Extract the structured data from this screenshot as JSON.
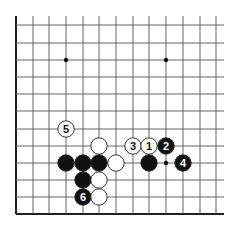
{
  "diagram": {
    "type": "go-board-fragment",
    "grid": {
      "columns_x": [
        16,
        33,
        49,
        66,
        83,
        99,
        116,
        133,
        149,
        166,
        183,
        200,
        216
      ],
      "rows_y": [
        25,
        43,
        60,
        77,
        94,
        111,
        129,
        146,
        163,
        180,
        197,
        214
      ],
      "line_extend_right": 224,
      "line_extend_top": 16,
      "edges": {
        "left": true,
        "bottom": true,
        "top": false,
        "right": false
      },
      "line_color": "#555555",
      "edge_color": "#222222"
    },
    "star_points": [
      {
        "col": 3,
        "row": 2
      },
      {
        "col": 9,
        "row": 2
      },
      {
        "col": 9,
        "row": 8
      }
    ],
    "stones": [
      {
        "color": "white",
        "col": 3,
        "row": 6,
        "label": "5"
      },
      {
        "color": "white",
        "col": 5,
        "row": 7,
        "label": ""
      },
      {
        "color": "white",
        "col": 7,
        "row": 7,
        "label": "3"
      },
      {
        "color": "white",
        "col": 8,
        "row": 7,
        "label": "1"
      },
      {
        "color": "black",
        "col": 9,
        "row": 7,
        "label": "2"
      },
      {
        "color": "black",
        "col": 3,
        "row": 8,
        "label": ""
      },
      {
        "color": "black",
        "col": 4,
        "row": 8,
        "label": ""
      },
      {
        "color": "black",
        "col": 5,
        "row": 8,
        "label": ""
      },
      {
        "color": "white",
        "col": 6,
        "row": 8,
        "label": ""
      },
      {
        "color": "black",
        "col": 8,
        "row": 8,
        "label": ""
      },
      {
        "color": "black",
        "col": 10,
        "row": 8,
        "label": "4"
      },
      {
        "color": "black",
        "col": 4,
        "row": 9,
        "label": ""
      },
      {
        "color": "white",
        "col": 5,
        "row": 9,
        "label": ""
      },
      {
        "color": "black",
        "col": 4,
        "row": 10,
        "label": "6"
      },
      {
        "color": "white",
        "col": 5,
        "row": 10,
        "label": ""
      }
    ],
    "colors": {
      "black_stone": "#111111",
      "white_stone": "#ffffff",
      "stone_outline": "#222222"
    }
  }
}
